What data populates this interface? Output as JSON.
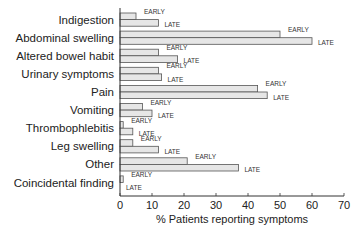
{
  "chart_data": {
    "type": "bar",
    "orientation": "horizontal",
    "title": "",
    "xlabel": "% Patients reporting symptoms",
    "ylabel": "",
    "xlim": [
      0,
      70
    ],
    "xticks": [
      0,
      10,
      20,
      30,
      40,
      50,
      60,
      70
    ],
    "grid": false,
    "legend": "inline bar labels (EARLY / LATE)",
    "categories": [
      "Indigestion",
      "Abdominal swelling",
      "Altered bowel habit",
      "Urinary symptoms",
      "Pain",
      "Vomiting",
      "Thrombophlebitis",
      "Leg swelling",
      "Other",
      "Coincidental finding"
    ],
    "series": [
      {
        "name": "EARLY",
        "values": [
          5,
          50,
          12,
          12,
          43,
          7,
          1,
          4,
          21,
          1
        ]
      },
      {
        "name": "LATE",
        "values": [
          12,
          60,
          18,
          13,
          46,
          10,
          4,
          12,
          37,
          0
        ]
      }
    ]
  },
  "labels": {
    "early": "EARLY",
    "late": "LATE"
  }
}
